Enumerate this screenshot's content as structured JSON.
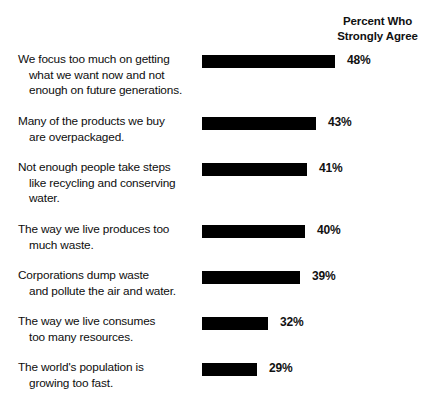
{
  "header": {
    "line1": "Percent Who",
    "line2": "Strongly Agree"
  },
  "chart_data": {
    "type": "bar",
    "title": "",
    "subtitle": "",
    "xlabel": "",
    "ylabel": "",
    "orientation": "horizontal",
    "grid": false,
    "legend": false,
    "value_suffix": "%",
    "bar_color": "#000000",
    "value_header": "Percent Who Strongly Agree",
    "xlim": [
      0,
      50
    ],
    "categories": [
      "We focus too much on getting what we want now and not enough on future generations.",
      "Many of the products we buy are overpackaged.",
      "Not enough people take steps like recycling and conserving water.",
      "The way we live produces too much waste.",
      "Corporations dump waste and pollute the air and water.",
      "The way we live consumes too many resources.",
      "The world's population is growing too fast."
    ],
    "values": [
      48,
      43,
      41,
      40,
      39,
      32,
      29
    ],
    "value_labels": [
      "48%",
      "43%",
      "41%",
      "40%",
      "39%",
      "32%",
      "29%"
    ]
  },
  "rows": [
    {
      "lines": [
        "We focus too much on getting",
        "what we want now and not",
        "enough on future generations."
      ],
      "value": "48%",
      "bar_px": 133,
      "label_px": 145,
      "row_height": 62
    },
    {
      "lines": [
        "Many of the products we buy",
        "are overpackaged."
      ],
      "value": "43%",
      "bar_px": 114,
      "label_px": 126,
      "row_height": 46
    },
    {
      "lines": [
        "Not enough people take steps",
        "like recycling and conserving",
        "water."
      ],
      "value": "41%",
      "bar_px": 105,
      "label_px": 117,
      "row_height": 62
    },
    {
      "lines": [
        "The way we live produces too",
        "much waste."
      ],
      "value": "40%",
      "bar_px": 103,
      "label_px": 115,
      "row_height": 46
    },
    {
      "lines": [
        "Corporations dump waste",
        "and pollute the air and water."
      ],
      "value": "39%",
      "bar_px": 98,
      "label_px": 110,
      "row_height": 46
    },
    {
      "lines": [
        "The way we live consumes",
        "too many resources."
      ],
      "value": "32%",
      "bar_px": 66,
      "label_px": 78,
      "row_height": 46
    },
    {
      "lines": [
        "The world's population is",
        "growing too fast."
      ],
      "value": "29%",
      "bar_px": 55,
      "label_px": 67,
      "row_height": 46
    }
  ]
}
